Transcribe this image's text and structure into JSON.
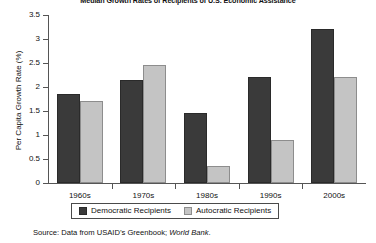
{
  "chart_data": {
    "type": "bar",
    "title": "Median Growth Rates of Recipients of U.S. Economic Assistance",
    "xlabel": "",
    "ylabel": "Per Capita Growth Rate (%)",
    "categories": [
      "1960s",
      "1970s",
      "1980s",
      "1990s",
      "2000s"
    ],
    "ylim": [
      0,
      3.5
    ],
    "yticks": [
      "0",
      "0.5",
      "1",
      "1.5",
      "2",
      "2.5",
      "3",
      "3.5"
    ],
    "ytick_values": [
      0,
      0.5,
      1,
      1.5,
      2,
      2.5,
      3,
      3.5
    ],
    "grid": false,
    "legend_position": "bottom",
    "series": [
      {
        "name": "Democratic Recipients",
        "color": "#3a3a3a",
        "values": [
          1.85,
          2.15,
          1.45,
          2.2,
          3.2
        ]
      },
      {
        "name": "Autocratic Recipients",
        "color": "#c4c4c4",
        "values": [
          1.7,
          2.45,
          0.35,
          0.9,
          2.2
        ]
      }
    ],
    "source_prefix": "Source: Data from USAID’s Greenbook; ",
    "source_italic": "World Bank",
    "source_suffix": "."
  }
}
